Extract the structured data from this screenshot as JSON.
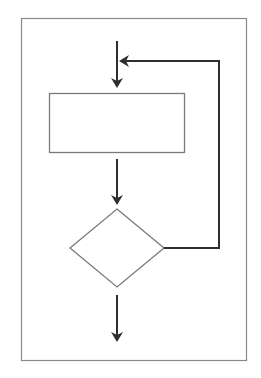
{
  "diagram": {
    "type": "flowchart",
    "colors": {
      "background": "#ffffff",
      "frame": "#8a8a8a",
      "shape_stroke": "#7a7a7a",
      "connector": "#2e2e2e"
    },
    "frame": {
      "x": 21,
      "y": 18,
      "width": 225,
      "height": 342
    },
    "nodes": [
      {
        "id": "process",
        "shape": "rectangle",
        "label": "",
        "x": 49,
        "y": 93,
        "width": 135,
        "height": 59
      },
      {
        "id": "decision",
        "shape": "diamond",
        "label": "",
        "cx": 117,
        "cy": 248,
        "half_width": 47,
        "half_height": 39
      }
    ],
    "edges": [
      {
        "id": "entry",
        "from": "start",
        "to": "process",
        "points": [
          [
            117,
            41
          ],
          [
            117,
            84
          ]
        ],
        "arrow": "end"
      },
      {
        "id": "process-to-decision",
        "from": "process",
        "to": "decision",
        "points": [
          [
            117,
            159
          ],
          [
            117,
            201
          ]
        ],
        "arrow": "end"
      },
      {
        "id": "loop-back",
        "from": "decision",
        "to": "entry",
        "points": [
          [
            163,
            248
          ],
          [
            219,
            248
          ],
          [
            219,
            61
          ],
          [
            123,
            61
          ]
        ],
        "arrow": "end"
      },
      {
        "id": "exit",
        "from": "decision",
        "to": "end",
        "points": [
          [
            117,
            295
          ],
          [
            117,
            338
          ]
        ],
        "arrow": "end"
      }
    ]
  }
}
